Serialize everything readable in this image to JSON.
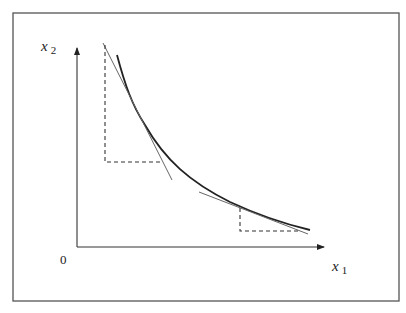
{
  "diagram": {
    "type": "indifference-curve",
    "y_axis_label": "x",
    "y_axis_subscript": "2",
    "x_axis_label": "x",
    "x_axis_subscript": "1",
    "origin_label": "0",
    "colors": {
      "frame": "#555555",
      "curve": "#222222",
      "tangent": "#555555",
      "dashed": "#333333"
    }
  }
}
